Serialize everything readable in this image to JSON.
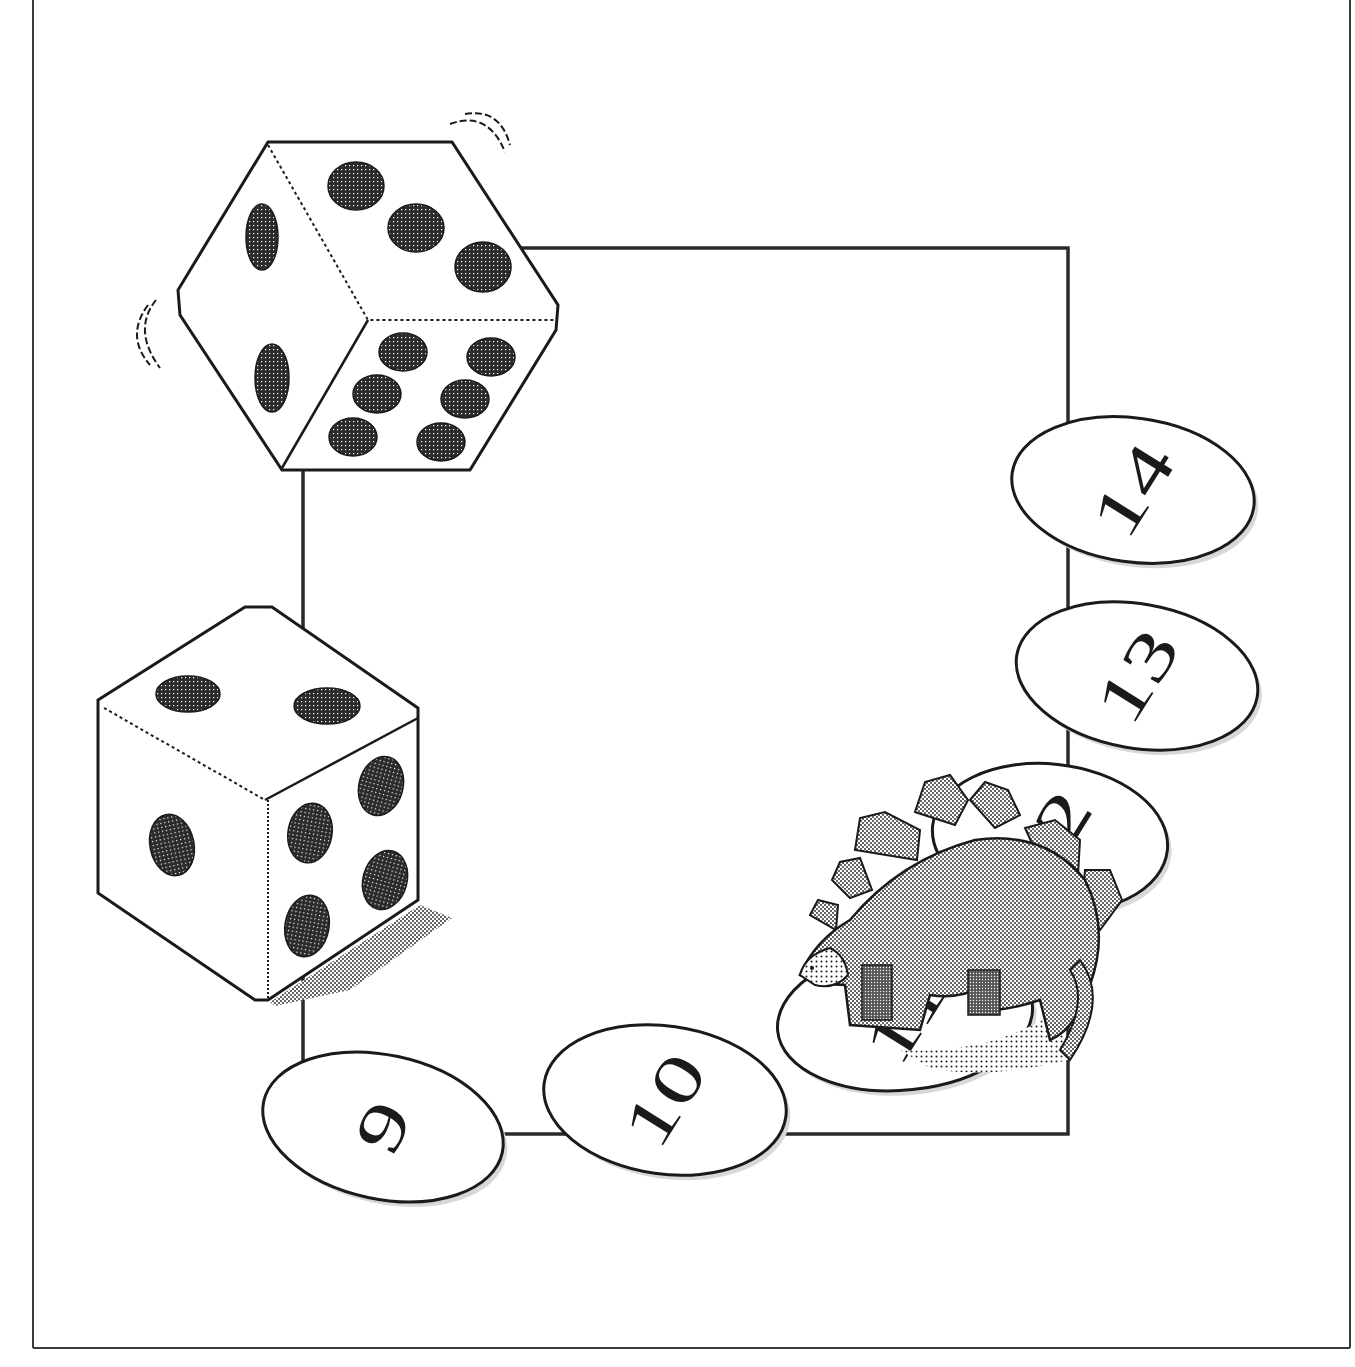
{
  "illustration": {
    "title": "Dice board game path",
    "colors": {
      "ink": "#1a1a1a",
      "paper": "#ffffff",
      "pip": "#2b2b2b",
      "stipple": "#8a8a8a",
      "frame": "#3a3a3a"
    },
    "frame": {
      "left": 33,
      "right": 1350,
      "bottom": 1348
    },
    "path_square": {
      "x": 303,
      "y": 248,
      "width": 765,
      "height": 886
    },
    "dice": [
      {
        "name": "top-die",
        "faces_visible": [
          3,
          2,
          6
        ],
        "motion_lines": true
      },
      {
        "name": "bottom-die",
        "faces_visible": [
          2,
          1,
          4
        ],
        "motion_lines": false
      }
    ],
    "tokens": [
      {
        "label": "9",
        "cx": 383,
        "cy": 1127,
        "rx": 122,
        "ry": 72,
        "rotate": 12,
        "obscured": false
      },
      {
        "label": "10",
        "cx": 665,
        "cy": 1100,
        "rx": 122,
        "ry": 74,
        "rotate": 8,
        "obscured": false
      },
      {
        "label": "11",
        "cx": 905,
        "cy": 1018,
        "rx": 128,
        "ry": 72,
        "rotate": -6,
        "obscured": true
      },
      {
        "label": "12",
        "cx": 1050,
        "cy": 838,
        "rx": 118,
        "ry": 74,
        "rotate": 6,
        "obscured": true
      },
      {
        "label": "13",
        "cx": 1137,
        "cy": 676,
        "rx": 122,
        "ry": 72,
        "rotate": 10,
        "obscured": false
      },
      {
        "label": "14",
        "cx": 1133,
        "cy": 490,
        "rx": 122,
        "ry": 72,
        "rotate": 8,
        "obscured": false
      }
    ],
    "character": {
      "name": "stegosaurus",
      "position": "over token 11"
    }
  }
}
